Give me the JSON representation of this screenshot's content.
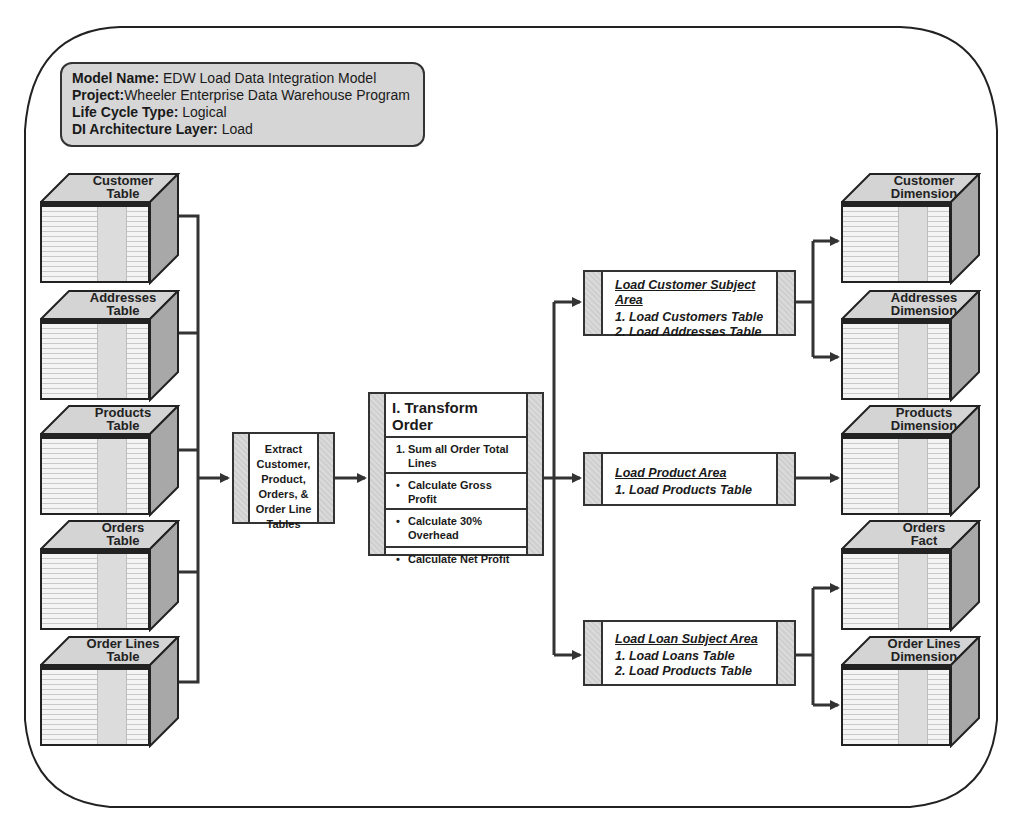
{
  "header": {
    "model_name_label": "Model Name:",
    "model_name_value": " EDW Load Data Integration Model",
    "project_label": "Project:",
    "project_value": "Wheeler Enterprise Data Warehouse Program",
    "life_cycle_label": "Life Cycle Type:",
    "life_cycle_value": " Logical",
    "layer_label": "DI Architecture Layer:",
    "layer_value": " Load"
  },
  "sources": [
    {
      "line1": "Customer",
      "line2": "Table"
    },
    {
      "line1": "Addresses",
      "line2": "Table"
    },
    {
      "line1": "Products",
      "line2": "Table"
    },
    {
      "line1": "Orders",
      "line2": "Table"
    },
    {
      "line1": "Order Lines",
      "line2": "Table"
    }
  ],
  "extract": {
    "lines": [
      "Extract",
      "Customer,",
      "Product,",
      "Orders, &",
      "Order Line",
      "Tables"
    ]
  },
  "transform": {
    "title": "I. Transform Order",
    "steps": [
      {
        "marker": "1.",
        "text": "Sum all Order Total Lines"
      },
      {
        "marker": "•",
        "text": "Calculate Gross Profit"
      },
      {
        "marker": "•",
        "text": "Calculate 30% Overhead"
      },
      {
        "marker": "•",
        "text": "Calculate Net Profit"
      }
    ]
  },
  "loads": [
    {
      "title": "Load Customer Subject Area",
      "items": [
        "1.  Load Customers Table",
        "2.  Load Addresses Table"
      ]
    },
    {
      "title": "Load Product Area",
      "items": [
        "1.  Load Products Table"
      ]
    },
    {
      "title": "Load Loan Subject Area",
      "items": [
        "1.  Load Loans Table",
        "2.  Load Products Table"
      ]
    }
  ],
  "targets": [
    {
      "line1": "Customer",
      "line2": "Dimension"
    },
    {
      "line1": "Addresses",
      "line2": "Dimension"
    },
    {
      "line1": "Products",
      "line2": "Dimension"
    },
    {
      "line1": "Orders",
      "line2": "Fact"
    },
    {
      "line1": "Order Lines",
      "line2": "Dimension"
    }
  ],
  "colors": {
    "line": "#333333",
    "cube_top": "#d4d4d4",
    "cube_side": "#a8a8a8",
    "header_fill": "#d6d6d6"
  }
}
